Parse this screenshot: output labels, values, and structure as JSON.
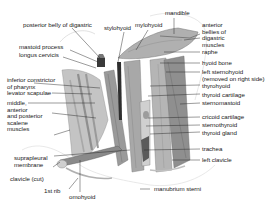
{
  "diagram": {
    "colors": {
      "muscle": "#9c9c9c",
      "muscle_dark": "#6e6e6e",
      "muscle_light": "#cfcfcf",
      "outline": "#8a8a8a",
      "leader": "#222222",
      "text": "#1a1a1a",
      "bone": "#eeeeee",
      "background": "#ffffff"
    },
    "labels_left": [
      {
        "id": "posterior-belly-digastric",
        "text": "posterior belly of digastric"
      },
      {
        "id": "mastoid-process",
        "text": "mastoid process"
      },
      {
        "id": "longus-cervicis",
        "text": "longus cervicis"
      },
      {
        "id": "inferior-constrictor",
        "text": "inferior constrictor\nof pharynx"
      },
      {
        "id": "levator-scapulae",
        "text": "levator scapulae"
      },
      {
        "id": "scalene-muscles",
        "text": "middle,\nanterior\nand posterior\nscalene\nmuscles"
      },
      {
        "id": "suprapleural-membrane",
        "text": "suprapleural\nmembrane"
      },
      {
        "id": "clavicle-cut",
        "text": "clavicle (cut)"
      },
      {
        "id": "first-rib",
        "text": "1st rib"
      },
      {
        "id": "omohyoid",
        "text": "omohyoid"
      }
    ],
    "labels_top": [
      {
        "id": "stylohyoid",
        "text": "stylohyoid"
      },
      {
        "id": "mylohyoid",
        "text": "mylohyoid"
      },
      {
        "id": "mandible",
        "text": "mandible"
      }
    ],
    "labels_right": [
      {
        "id": "anterior-bellies-digastric",
        "text": "anterior\nbellies of\ndigastric\nmuscles"
      },
      {
        "id": "raphe",
        "text": "raphe"
      },
      {
        "id": "hyoid-bone",
        "text": "hyoid bone"
      },
      {
        "id": "left-sternohyoid",
        "text": "left sternohyoid\n(removed on right side)"
      },
      {
        "id": "thyrohyoid",
        "text": "thyrohyoid"
      },
      {
        "id": "thyroid-cartilage",
        "text": "thyroid cartilage"
      },
      {
        "id": "sternomastoid",
        "text": "sternomastoid"
      },
      {
        "id": "cricoid-cartilage",
        "text": "cricoid cartilage"
      },
      {
        "id": "sternothyroid",
        "text": "sternothyroid"
      },
      {
        "id": "thyroid-gland",
        "text": "thyroid gland"
      },
      {
        "id": "trachea",
        "text": "trachea"
      },
      {
        "id": "left-clavicle",
        "text": "left clavicle"
      },
      {
        "id": "manubrium-sterni",
        "text": "manubrium sterni"
      }
    ]
  }
}
